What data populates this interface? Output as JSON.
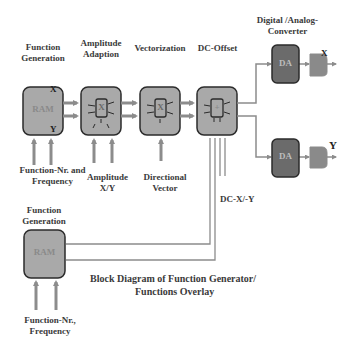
{
  "labels": {
    "function_generation_top": [
      "Function",
      "Generation"
    ],
    "amplitude_adaption": [
      "Amplitude",
      "Adaption"
    ],
    "vectorization": "Vectorization",
    "dc_offset": "DC-Offset",
    "dac": [
      "Digital /Analog-",
      "Converter"
    ],
    "function_nr_frequency_top": [
      "Function-Nr. and",
      "Frequency"
    ],
    "amplitude_xy": [
      "Amplitude",
      "X/Y"
    ],
    "directional_vector": [
      "Directional",
      "Vector"
    ],
    "dc_xy": "DC-X/-Y",
    "function_generation_bottom": [
      "Function",
      "Generation"
    ],
    "function_nr_frequency_bottom": [
      "Function-Nr.,",
      "Frequency"
    ],
    "caption": [
      "Block Diagram of Function Generator/",
      "Functions Overlay"
    ]
  },
  "blocks": {
    "ram_top": "RAM",
    "ram_top_x": "X",
    "ram_top_y": "Y",
    "amp_inner": "X",
    "vec_inner": "X",
    "dc_inner": "+",
    "da_top": "DA",
    "da_bottom": "DA",
    "ram_bottom": "RAM",
    "out_x": "X",
    "out_y": "Y"
  },
  "colors": {
    "block_fill": "#a9a9a9",
    "block_border": "#2b2b2b",
    "da_fill": "#6b6b6b",
    "arrow": "#8c8c8c",
    "text": "#3a3a3a"
  }
}
